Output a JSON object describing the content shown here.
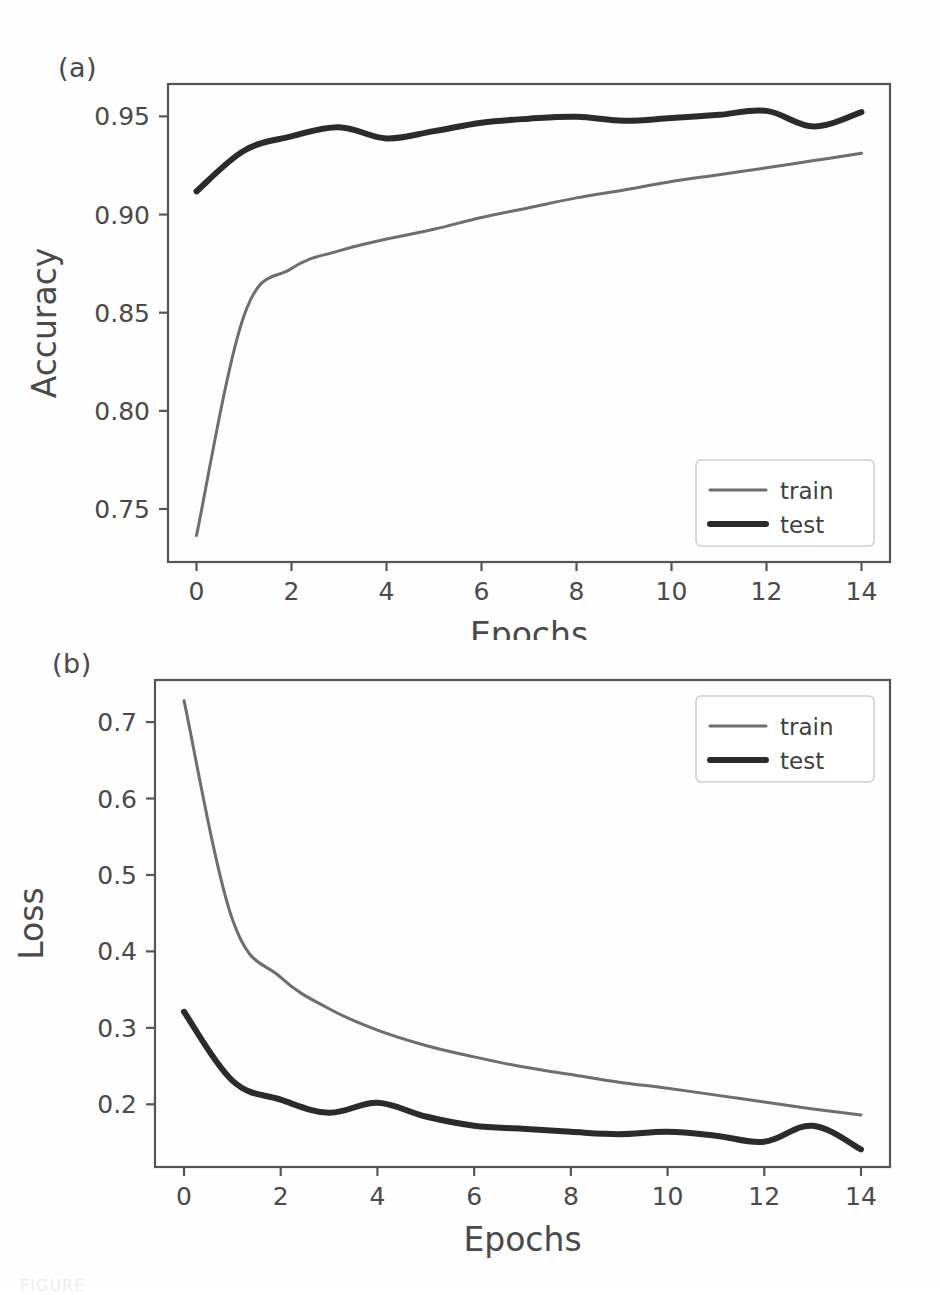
{
  "figure": {
    "panel_a_tag": "(a)",
    "panel_b_tag": "(b)",
    "caption_fragment": "FIGURE"
  },
  "style": {
    "train_color": "#6e6e6e",
    "test_color": "#2b2b2b",
    "axis_color": "#555555",
    "background": "#fefefe",
    "legend_border": "#cfcfcf",
    "train_width": 3,
    "test_width": 6
  },
  "chart_data": [
    {
      "id": "panel-a",
      "type": "line",
      "title": "",
      "panel_label": "(a)",
      "xlabel": "Epochs",
      "ylabel": "Accuracy",
      "xlim": [
        -0.6,
        14.6
      ],
      "ylim": [
        0.723,
        0.9665
      ],
      "xticks": [
        0,
        2,
        4,
        6,
        8,
        10,
        12,
        14
      ],
      "xticklabels": [
        "0",
        "2",
        "4",
        "6",
        "8",
        "10",
        "12",
        "14"
      ],
      "yticks": [
        0.75,
        0.8,
        0.85,
        0.9,
        0.95
      ],
      "yticklabels": [
        "0.75",
        "0.80",
        "0.85",
        "0.90",
        "0.95"
      ],
      "grid": false,
      "legend_position": "lower right",
      "x": [
        0,
        1,
        2,
        3,
        4,
        5,
        6,
        7,
        8,
        9,
        10,
        11,
        12,
        13,
        14
      ],
      "series": [
        {
          "name": "train",
          "values": [
            0.7365,
            0.8485,
            0.8725,
            0.8815,
            0.8875,
            0.8925,
            0.8985,
            0.9035,
            0.9085,
            0.9125,
            0.9168,
            0.9203,
            0.9238,
            0.9275,
            0.9312
          ]
        },
        {
          "name": "test",
          "values": [
            0.9118,
            0.9325,
            0.9398,
            0.9445,
            0.9388,
            0.9425,
            0.9468,
            0.9488,
            0.9498,
            0.9478,
            0.9492,
            0.9508,
            0.9528,
            0.9448,
            0.9522
          ]
        }
      ]
    },
    {
      "id": "panel-b",
      "type": "line",
      "title": "",
      "panel_label": "(b)",
      "xlabel": "Epochs",
      "ylabel": "Loss",
      "xlim": [
        -0.6,
        14.6
      ],
      "ylim": [
        0.118,
        0.755
      ],
      "xticks": [
        0,
        2,
        4,
        6,
        8,
        10,
        12,
        14
      ],
      "xticklabels": [
        "0",
        "2",
        "4",
        "6",
        "8",
        "10",
        "12",
        "14"
      ],
      "yticks": [
        0.2,
        0.3,
        0.4,
        0.5,
        0.6,
        0.7
      ],
      "yticklabels": [
        "0.2",
        "0.3",
        "0.4",
        "0.5",
        "0.6",
        "0.7"
      ],
      "grid": false,
      "legend_position": "upper right",
      "x": [
        0,
        1,
        2,
        3,
        4,
        5,
        6,
        7,
        8,
        9,
        10,
        11,
        12,
        13,
        14
      ],
      "series": [
        {
          "name": "train",
          "values": [
            0.728,
            0.442,
            0.366,
            0.325,
            0.297,
            0.277,
            0.262,
            0.249,
            0.239,
            0.229,
            0.221,
            0.212,
            0.203,
            0.194,
            0.186
          ]
        },
        {
          "name": "test",
          "values": [
            0.321,
            0.231,
            0.206,
            0.189,
            0.202,
            0.184,
            0.172,
            0.168,
            0.164,
            0.161,
            0.164,
            0.159,
            0.151,
            0.172,
            0.141
          ]
        }
      ]
    }
  ],
  "legend": {
    "entries": [
      {
        "label": "train",
        "kind": "train-line"
      },
      {
        "label": "test",
        "kind": "test-line"
      }
    ]
  }
}
